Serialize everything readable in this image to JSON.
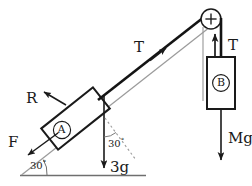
{
  "diagram": {
    "colors": {
      "ink": "#1a1a1a",
      "incline": "#8a8a8a",
      "rope": "#141414",
      "background": "#ffffff",
      "dashed": "#9a9a9a"
    },
    "incline_angle": "30",
    "degree_symbol": "°",
    "blocks": [
      {
        "id": "A",
        "label": "A",
        "name": "block-a",
        "position": "on incline"
      },
      {
        "id": "B",
        "label": "B",
        "name": "block-b",
        "position": "hanging"
      }
    ],
    "forces": [
      {
        "name": "normal-force",
        "label": "R",
        "on": "A",
        "direction": "perpendicular to incline, up-left"
      },
      {
        "name": "friction-force",
        "label": "F",
        "on": "A",
        "direction": "down the incline, lower-left"
      },
      {
        "name": "tension-on-a",
        "label": "T",
        "on": "A",
        "direction": "up the incline, toward pulley"
      },
      {
        "name": "weight-of-a",
        "label": "3g",
        "on": "A",
        "direction": "vertically downward"
      },
      {
        "name": "tension-on-b",
        "label": "T",
        "on": "B",
        "direction": "vertically upward"
      },
      {
        "name": "weight-of-b",
        "label": "Mg",
        "on": "B",
        "direction": "vertically downward"
      }
    ],
    "angles": [
      {
        "name": "incline-base-angle",
        "value": "30",
        "unit": "°",
        "at": "base of incline"
      },
      {
        "name": "weight-incline-angle",
        "value": "30",
        "unit": "°",
        "at": "between weight 3g and normal to incline"
      }
    ],
    "pulley": {
      "name": "pulley",
      "label": "",
      "glyph": "+"
    },
    "labels": {
      "R": "R",
      "F": "F",
      "T_rope": "T",
      "T_block": "T",
      "weight_a": "3g",
      "weight_b": "Mg",
      "block_a": "A",
      "block_b": "B",
      "angle_base": "30",
      "angle_weight": "30",
      "deg": "°"
    }
  }
}
